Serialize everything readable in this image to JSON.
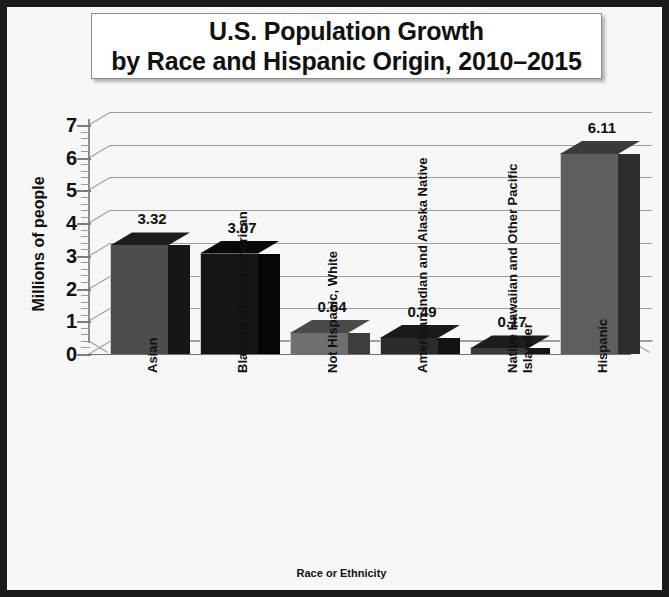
{
  "title": {
    "line1": "U.S. Population Growth",
    "line2": "by Race and Hispanic Origin, 2010–2015"
  },
  "axes": {
    "ylabel": "Millions of people",
    "xlabel": "Race or Ethnicity",
    "yticks": [
      "7",
      "6",
      "5",
      "4",
      "3",
      "2",
      "1",
      "0"
    ]
  },
  "chart_data": {
    "type": "bar",
    "title": "U.S. Population Growth by Race and Hispanic Origin, 2010–2015",
    "xlabel": "Race or Ethnicity",
    "ylabel": "Millions of people",
    "ylim": [
      0,
      7
    ],
    "ytick_values": [
      0,
      1,
      2,
      3,
      4,
      5,
      6,
      7
    ],
    "grid": true,
    "legend": "none",
    "style": "3d-column",
    "categories": [
      "Asian",
      "Black or African American",
      "Not Hispanic, White",
      "American Indian and Alaska Native",
      "Native Hawaiian and Other Pacific\nIslander",
      "Hispanic"
    ],
    "values": [
      3.32,
      3.07,
      0.64,
      0.49,
      0.17,
      6.11
    ],
    "value_labels": [
      "3.32",
      "3.07",
      "0.64",
      "0.49",
      "0.17",
      "6.11"
    ],
    "bar_colors": [
      "#4d4d4d",
      "#151515",
      "#6f6f6f",
      "#2b2b2b",
      "#3a3a3a",
      "#5e5e5e"
    ],
    "bar_side_colors": [
      "#161616",
      "#050505",
      "#3d3d3d",
      "#121212",
      "#151515",
      "#2e2e2e"
    ],
    "bar_top_colors": [
      "#1d1d1d",
      "#070707",
      "#4a4a4a",
      "#1a1a1a",
      "#1d1d1d",
      "#3a3a3a"
    ]
  },
  "colors": {
    "frame": "#1b1b1b",
    "plot_background": "#f7f7f7",
    "gridline": "#9d9d9d",
    "text": "#111111"
  }
}
